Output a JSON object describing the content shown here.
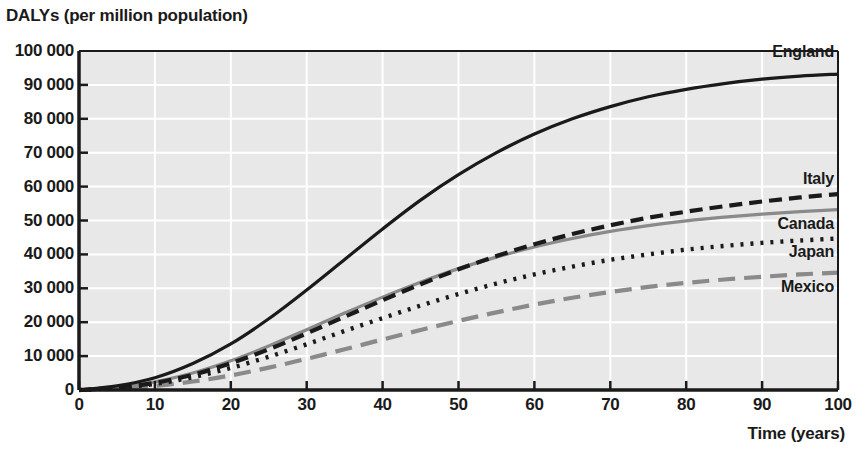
{
  "chart_data": {
    "type": "line",
    "title": "",
    "xlabel": "Time (years)",
    "ylabel": "DALYs (per million population)",
    "xlim": [
      0,
      100
    ],
    "ylim": [
      0,
      100000
    ],
    "xticks": [
      0,
      10,
      20,
      30,
      40,
      50,
      60,
      70,
      80,
      90,
      100
    ],
    "xtick_labels": [
      "0",
      "10",
      "20",
      "30",
      "40",
      "50",
      "60",
      "70",
      "80",
      "90",
      "100"
    ],
    "yticks": [
      0,
      10000,
      20000,
      30000,
      40000,
      50000,
      60000,
      70000,
      80000,
      90000,
      100000
    ],
    "ytick_labels": [
      "0",
      "10 000",
      "20 000",
      "30 000",
      "40 000",
      "50 000",
      "60 000",
      "70 000",
      "80 000",
      "90 000",
      "100 000"
    ],
    "grid": true,
    "grid_color": "#ffffff",
    "plot_background": "#e8e8e8",
    "legend_position": "right-inline",
    "x": [
      0,
      5,
      10,
      15,
      20,
      25,
      30,
      35,
      40,
      45,
      50,
      55,
      60,
      65,
      70,
      75,
      80,
      85,
      90,
      95,
      100
    ],
    "series": [
      {
        "name": "England",
        "color": "#1a1a1a",
        "style": "solid",
        "label_value": 93000,
        "values": [
          0,
          1200,
          3600,
          7800,
          13600,
          21000,
          29500,
          38500,
          47500,
          56000,
          63500,
          70000,
          75500,
          80000,
          83600,
          86500,
          88700,
          90400,
          91700,
          92600,
          93200
        ]
      },
      {
        "name": "Italy",
        "color": "#1a1a1a",
        "style": "dashed",
        "label_value": 59000,
        "values": [
          0,
          700,
          2100,
          4500,
          7900,
          12000,
          16700,
          21600,
          26500,
          31200,
          35600,
          39500,
          43000,
          46000,
          48600,
          50800,
          52600,
          54200,
          55600,
          56800,
          57800
        ]
      },
      {
        "name": "Canada",
        "color": "#8a8a8a",
        "style": "solid",
        "label_value": 57000,
        "values": [
          0,
          800,
          2400,
          5000,
          8600,
          13000,
          17800,
          22700,
          27400,
          31800,
          35800,
          39200,
          42200,
          44700,
          46800,
          48500,
          49900,
          51000,
          51900,
          52600,
          53200
        ]
      },
      {
        "name": "Japan",
        "color": "#1a1a1a",
        "style": "dotted",
        "label_value": 47000,
        "values": [
          0,
          600,
          1800,
          3800,
          6500,
          9800,
          13500,
          17400,
          21200,
          24900,
          28300,
          31400,
          34100,
          36400,
          38400,
          40000,
          41400,
          42500,
          43400,
          44100,
          44700
        ]
      },
      {
        "name": "Mexico",
        "color": "#8a8a8a",
        "style": "longdash",
        "label_value": 37500,
        "values": [
          0,
          400,
          1200,
          2500,
          4300,
          6600,
          9200,
          12000,
          14900,
          17700,
          20400,
          22900,
          25200,
          27200,
          28900,
          30400,
          31600,
          32600,
          33400,
          34100,
          34600
        ]
      }
    ]
  },
  "axes": {
    "y_axis_title": "DALYs (per million population)",
    "x_axis_title": "Time (years)"
  }
}
